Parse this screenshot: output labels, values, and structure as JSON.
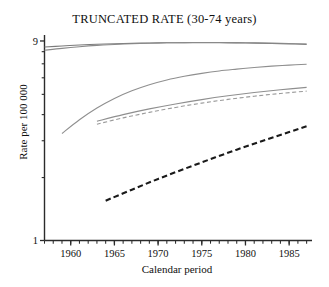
{
  "chart_data": {
    "type": "line",
    "title": "TRUNCATED RATE (30-74 years)",
    "xlabel": "Calendar period",
    "ylabel": "Rate per 100 000",
    "yscale": "log",
    "ylim": [
      1,
      9.3
    ],
    "xlim": [
      1957,
      1987.5
    ],
    "grid": false,
    "legend": "none",
    "ytick_labels": [
      "9",
      "1"
    ],
    "ytick_values": [
      9,
      1
    ],
    "yminor_ticks": [
      8,
      7,
      6,
      5,
      4,
      3,
      2
    ],
    "xtick_labels": [
      "1960",
      "1965",
      "1970",
      "1975",
      "1980",
      "1985"
    ],
    "xtick_values": [
      1960,
      1965,
      1970,
      1975,
      1980,
      1985
    ],
    "xminor_tick_step": 1,
    "series": [
      {
        "name": "series-1-grey-solid-upper",
        "style": "solid",
        "color": "#7b7b7b",
        "width": 1.1,
        "x": [
          1957,
          1959,
          1961,
          1963,
          1965,
          1967,
          1969,
          1971,
          1973,
          1975,
          1977,
          1979,
          1981,
          1983,
          1985,
          1987
        ],
        "y": [
          8.42,
          8.52,
          8.61,
          8.68,
          8.73,
          8.77,
          8.8,
          8.82,
          8.83,
          8.83,
          8.82,
          8.81,
          8.79,
          8.76,
          8.72,
          8.67
        ]
      },
      {
        "name": "series-2-grey-solid-upper2",
        "style": "solid",
        "color": "#8a8a8a",
        "width": 1.1,
        "x": [
          1957,
          1959,
          1961,
          1963,
          1965,
          1967,
          1969,
          1971,
          1973,
          1975,
          1977,
          1979,
          1981,
          1983,
          1985,
          1987
        ],
        "y": [
          8.12,
          8.3,
          8.45,
          8.57,
          8.66,
          8.73,
          8.78,
          8.82,
          8.84,
          8.85,
          8.85,
          8.84,
          8.82,
          8.79,
          8.75,
          8.7
        ]
      },
      {
        "name": "series-3-grey-curve-rising",
        "style": "solid",
        "color": "#8f8f8f",
        "width": 1.1,
        "x": [
          1959,
          1961,
          1963,
          1965,
          1967,
          1969,
          1971,
          1973,
          1975,
          1977,
          1979,
          1981,
          1983,
          1985,
          1987
        ],
        "y": [
          3.25,
          3.78,
          4.3,
          4.78,
          5.2,
          5.56,
          5.86,
          6.1,
          6.3,
          6.47,
          6.6,
          6.72,
          6.82,
          6.9,
          6.97
        ]
      },
      {
        "name": "series-4-grey-solid-middle",
        "style": "solid",
        "color": "#8f8f8f",
        "width": 1.1,
        "x": [
          1963,
          1966,
          1969,
          1972,
          1975,
          1978,
          1981,
          1984,
          1987
        ],
        "y": [
          3.72,
          4.0,
          4.26,
          4.5,
          4.72,
          4.92,
          5.1,
          5.26,
          5.4
        ]
      },
      {
        "name": "series-5-grey-dashed-middle",
        "style": "dashed",
        "color": "#9a9a9a",
        "width": 1.1,
        "x": [
          1963,
          1966,
          1969,
          1972,
          1975,
          1978,
          1981,
          1984,
          1987
        ],
        "y": [
          3.6,
          3.86,
          4.1,
          4.33,
          4.54,
          4.73,
          4.9,
          5.05,
          5.18
        ]
      },
      {
        "name": "series-6-black-dashed-lower",
        "style": "dashed",
        "color": "#1a1a1a",
        "width": 2.1,
        "x": [
          1964,
          1967,
          1970,
          1973,
          1976,
          1979,
          1982,
          1985,
          1987
        ],
        "y": [
          1.55,
          1.75,
          1.97,
          2.2,
          2.45,
          2.72,
          3.0,
          3.3,
          3.52
        ]
      }
    ]
  },
  "colors": {
    "axis": "#2b2b2b",
    "text": "#101010",
    "background": "#ffffff"
  }
}
